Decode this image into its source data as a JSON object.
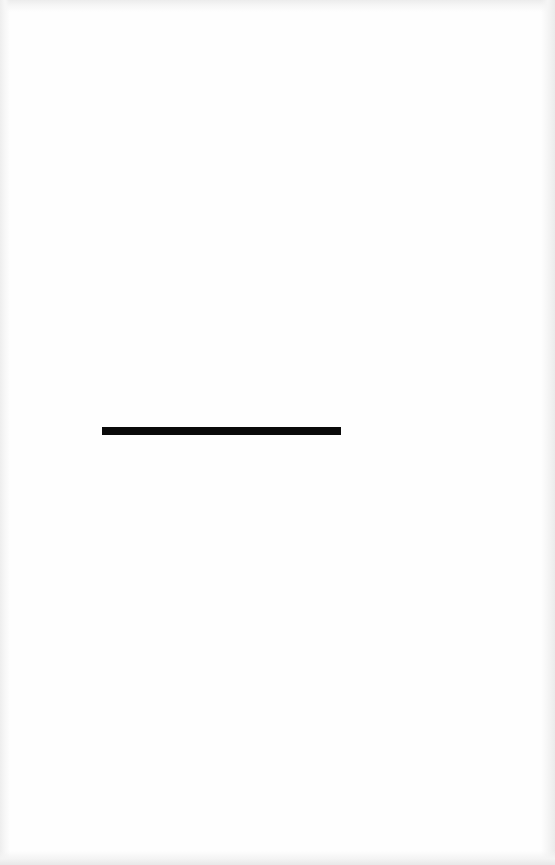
{
  "page": {
    "background_color": "#fefefe",
    "type": "scanned-blank-page"
  },
  "rule": {
    "color": "#0a0a0a",
    "x": 102,
    "y": 427,
    "width": 239,
    "height": 8
  }
}
